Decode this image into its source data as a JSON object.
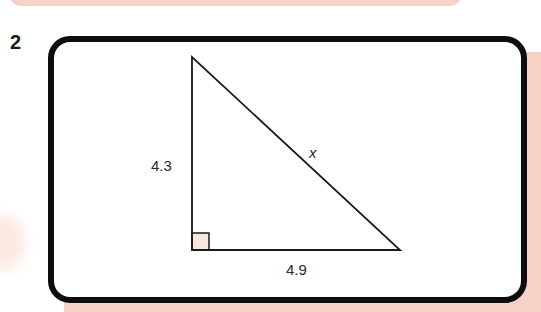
{
  "question": {
    "number": "2"
  },
  "triangle": {
    "type": "right-triangle",
    "vertical_side_label": "4.3",
    "horizontal_side_label": "4.9",
    "hypotenuse_label": "x",
    "right_angle_marker": true
  },
  "colors": {
    "accent_pink": "#f6d3c6",
    "frame": "#0d0d0d",
    "line": "#1a1a1a",
    "right_angle_fill": "#f8e6df"
  }
}
